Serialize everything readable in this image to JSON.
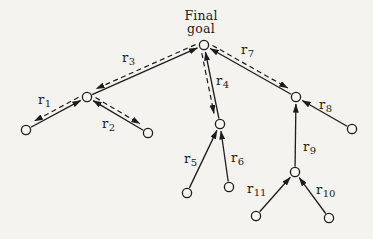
{
  "title": {
    "line1": "Final",
    "line2": "goal"
  },
  "colors": {
    "background": "#f4f3ef",
    "ink": "#1c1c1c",
    "node_fill": "#f7f6f2"
  },
  "diagram": {
    "canvas": {
      "width": 373,
      "height": 239
    },
    "node_radius": 4.6,
    "nodes": [
      {
        "id": "goal",
        "x": 204,
        "y": 45
      },
      {
        "id": "left-hub",
        "x": 87,
        "y": 97
      },
      {
        "id": "left-leaf",
        "x": 26,
        "y": 130
      },
      {
        "id": "r2-leaf",
        "x": 148,
        "y": 133
      },
      {
        "id": "mid",
        "x": 220,
        "y": 124
      },
      {
        "id": "r5-leaf",
        "x": 187,
        "y": 193
      },
      {
        "id": "r6-leaf",
        "x": 229,
        "y": 187
      },
      {
        "id": "right-hub",
        "x": 296,
        "y": 97
      },
      {
        "id": "r8-leaf",
        "x": 352,
        "y": 129
      },
      {
        "id": "lower-hub",
        "x": 295,
        "y": 172
      },
      {
        "id": "r11-leaf",
        "x": 256,
        "y": 216
      },
      {
        "id": "r10-leaf",
        "x": 329,
        "y": 218
      }
    ],
    "edges": [
      {
        "id": "r1",
        "label": {
          "base": "r",
          "sub": "1"
        },
        "from": "left-leaf",
        "to": "left-hub",
        "two_way": true,
        "dash_side": "up",
        "label_pos": {
          "x": 38,
          "y": 104
        }
      },
      {
        "id": "r2",
        "label": {
          "base": "r",
          "sub": "2"
        },
        "from": "r2-leaf",
        "to": "left-hub",
        "two_way": true,
        "dash_side": "up",
        "label_pos": {
          "x": 102,
          "y": 128
        }
      },
      {
        "id": "r3",
        "label": {
          "base": "r",
          "sub": "3"
        },
        "from": "left-hub",
        "to": "goal",
        "two_way": true,
        "dash_side": "up",
        "label_pos": {
          "x": 122,
          "y": 62
        }
      },
      {
        "id": "r4",
        "label": {
          "base": "r",
          "sub": "4"
        },
        "from": "mid",
        "to": "goal",
        "two_way": true,
        "dash_side": "left",
        "label_pos": {
          "x": 216,
          "y": 85
        }
      },
      {
        "id": "r5",
        "label": {
          "base": "r",
          "sub": "5"
        },
        "from": "r5-leaf",
        "to": "mid",
        "two_way": false,
        "dash_side": "",
        "label_pos": {
          "x": 184,
          "y": 163
        }
      },
      {
        "id": "r6",
        "label": {
          "base": "r",
          "sub": "6"
        },
        "from": "r6-leaf",
        "to": "mid",
        "two_way": false,
        "dash_side": "",
        "label_pos": {
          "x": 231,
          "y": 162
        }
      },
      {
        "id": "r7",
        "label": {
          "base": "r",
          "sub": "7"
        },
        "from": "right-hub",
        "to": "goal",
        "two_way": true,
        "dash_side": "up",
        "label_pos": {
          "x": 241,
          "y": 54
        }
      },
      {
        "id": "r8",
        "label": {
          "base": "r",
          "sub": "8"
        },
        "from": "r8-leaf",
        "to": "right-hub",
        "two_way": false,
        "dash_side": "",
        "label_pos": {
          "x": 319,
          "y": 109
        }
      },
      {
        "id": "r9",
        "label": {
          "base": "r",
          "sub": "9"
        },
        "from": "lower-hub",
        "to": "right-hub",
        "two_way": false,
        "dash_side": "",
        "label_pos": {
          "x": 303,
          "y": 151
        }
      },
      {
        "id": "r10",
        "label": {
          "base": "r",
          "sub": "10"
        },
        "from": "r10-leaf",
        "to": "lower-hub",
        "two_way": false,
        "dash_side": "",
        "label_pos": {
          "x": 316,
          "y": 194
        }
      },
      {
        "id": "r11",
        "label": {
          "base": "r",
          "sub": "11"
        },
        "from": "r11-leaf",
        "to": "lower-hub",
        "two_way": false,
        "dash_side": "",
        "label_pos": {
          "x": 247,
          "y": 193
        }
      }
    ]
  }
}
